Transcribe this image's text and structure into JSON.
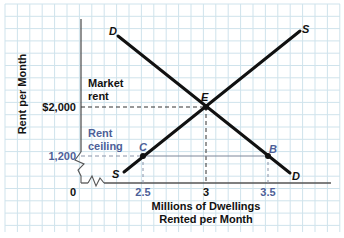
{
  "chart_data": {
    "type": "line",
    "title": "",
    "xlabel": "Millions of Dwellings Rented per Month",
    "xlabel_lines": [
      "Millions of Dwellings",
      "Rented per Month"
    ],
    "ylabel": "Rent per Month",
    "x_ticks": [
      {
        "value": 0,
        "label": "0"
      },
      {
        "value": 2.5,
        "label": "2.5"
      },
      {
        "value": 3,
        "label": "3"
      },
      {
        "value": 3.5,
        "label": "3.5"
      }
    ],
    "y_ticks": [
      {
        "value": 1200,
        "label": "1,200"
      },
      {
        "value": 2000,
        "label": "$2,000"
      }
    ],
    "series": [
      {
        "name": "D",
        "label": "D",
        "kind": "demand",
        "points": [
          [
            1.9,
            2600
          ],
          [
            3.9,
            1050
          ]
        ]
      },
      {
        "name": "S",
        "label": "S",
        "kind": "supply",
        "points": [
          [
            2.1,
            1050
          ],
          [
            4.1,
            2700
          ]
        ]
      }
    ],
    "points": [
      {
        "name": "E",
        "x": 3,
        "y": 2000,
        "label": "E"
      },
      {
        "name": "C",
        "x": 2.5,
        "y": 1200,
        "label": "C"
      },
      {
        "name": "B",
        "x": 3.5,
        "y": 1200,
        "label": "B"
      }
    ],
    "annotations": [
      {
        "text": "Market rent",
        "lines": [
          "Market",
          "rent"
        ],
        "at_y": 2000
      },
      {
        "text": "Rent ceiling",
        "lines": [
          "Rent",
          "ceiling"
        ],
        "at_y": 1200
      }
    ],
    "axis_breaks": [
      "x",
      "y"
    ],
    "grid": true,
    "legend": "none"
  },
  "colors": {
    "grid": "#cfe3ec",
    "axis": "#555555",
    "curve": "#111111",
    "ceiling": "#4d5f98",
    "text": "#111111"
  }
}
